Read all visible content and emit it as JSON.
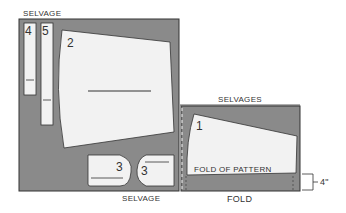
{
  "diagram": {
    "type": "sewing-pattern-layout",
    "layout_left": {
      "top_label": "SELVAGE",
      "bottom_label": "SELVAGE",
      "pieces": [
        {
          "id": "4",
          "label": "4"
        },
        {
          "id": "5",
          "label": "5"
        },
        {
          "id": "2",
          "label": "2"
        },
        {
          "id": "3a",
          "label": "3"
        },
        {
          "id": "3b",
          "label": "3"
        }
      ]
    },
    "layout_right": {
      "top_label": "SELVAGES",
      "bottom_label": "FOLD",
      "pieces": [
        {
          "id": "1",
          "label": "1",
          "fold_text": "FOLD OF PATTERN"
        }
      ],
      "dimension_label": "4\""
    },
    "colors": {
      "fabric": "#8a8a8a",
      "piece": "#f2f2f2",
      "outline": "#333333"
    }
  }
}
